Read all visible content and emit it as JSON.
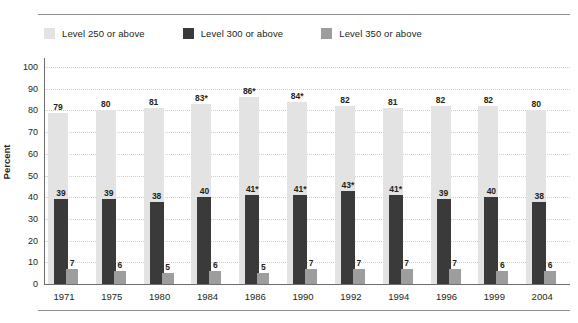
{
  "chart_data": {
    "type": "bar",
    "title": "",
    "subtitle": "",
    "xlabel": "",
    "ylabel": "Percent",
    "ylim": [
      0,
      100
    ],
    "ytick_step": 10,
    "yticks": [
      "100",
      "90",
      "80",
      "70",
      "60",
      "50",
      "40",
      "30",
      "20",
      "10",
      "0"
    ],
    "grid": true,
    "legend_position": "top-left",
    "categories": [
      "1971",
      "1975",
      "1980",
      "1984",
      "1986",
      "1990",
      "1992",
      "1994",
      "1996",
      "1999",
      "2004"
    ],
    "series": [
      {
        "name": "Level 250 or above",
        "color": "#e3e3e3",
        "values": [
          79,
          80,
          81,
          83,
          86,
          84,
          82,
          81,
          82,
          82,
          80
        ],
        "labels": [
          "79",
          "80",
          "81",
          "83*",
          "86*",
          "84*",
          "82",
          "81",
          "82",
          "82",
          "80"
        ]
      },
      {
        "name": "Level 300 or above",
        "color": "#3a3a3a",
        "values": [
          39,
          39,
          38,
          40,
          41,
          41,
          43,
          41,
          39,
          40,
          38
        ],
        "labels": [
          "39",
          "39",
          "38",
          "40",
          "41*",
          "41*",
          "43*",
          "41*",
          "39",
          "40",
          "38"
        ]
      },
      {
        "name": "Level 350 or above",
        "color": "#9d9d9d",
        "values": [
          7,
          6,
          5,
          6,
          5,
          7,
          7,
          7,
          7,
          6,
          6
        ],
        "labels": [
          "7",
          "6",
          "5",
          "6",
          "5",
          "7",
          "7",
          "7",
          "7",
          "6",
          "6"
        ]
      }
    ]
  },
  "legend": {
    "items": [
      {
        "label": "Level 250 or above",
        "color": "#e3e3e3"
      },
      {
        "label": "Level 300 or above",
        "color": "#3a3a3a"
      },
      {
        "label": "Level 350 or above",
        "color": "#9d9d9d"
      }
    ]
  },
  "axis": {
    "y_title": "Percent"
  }
}
